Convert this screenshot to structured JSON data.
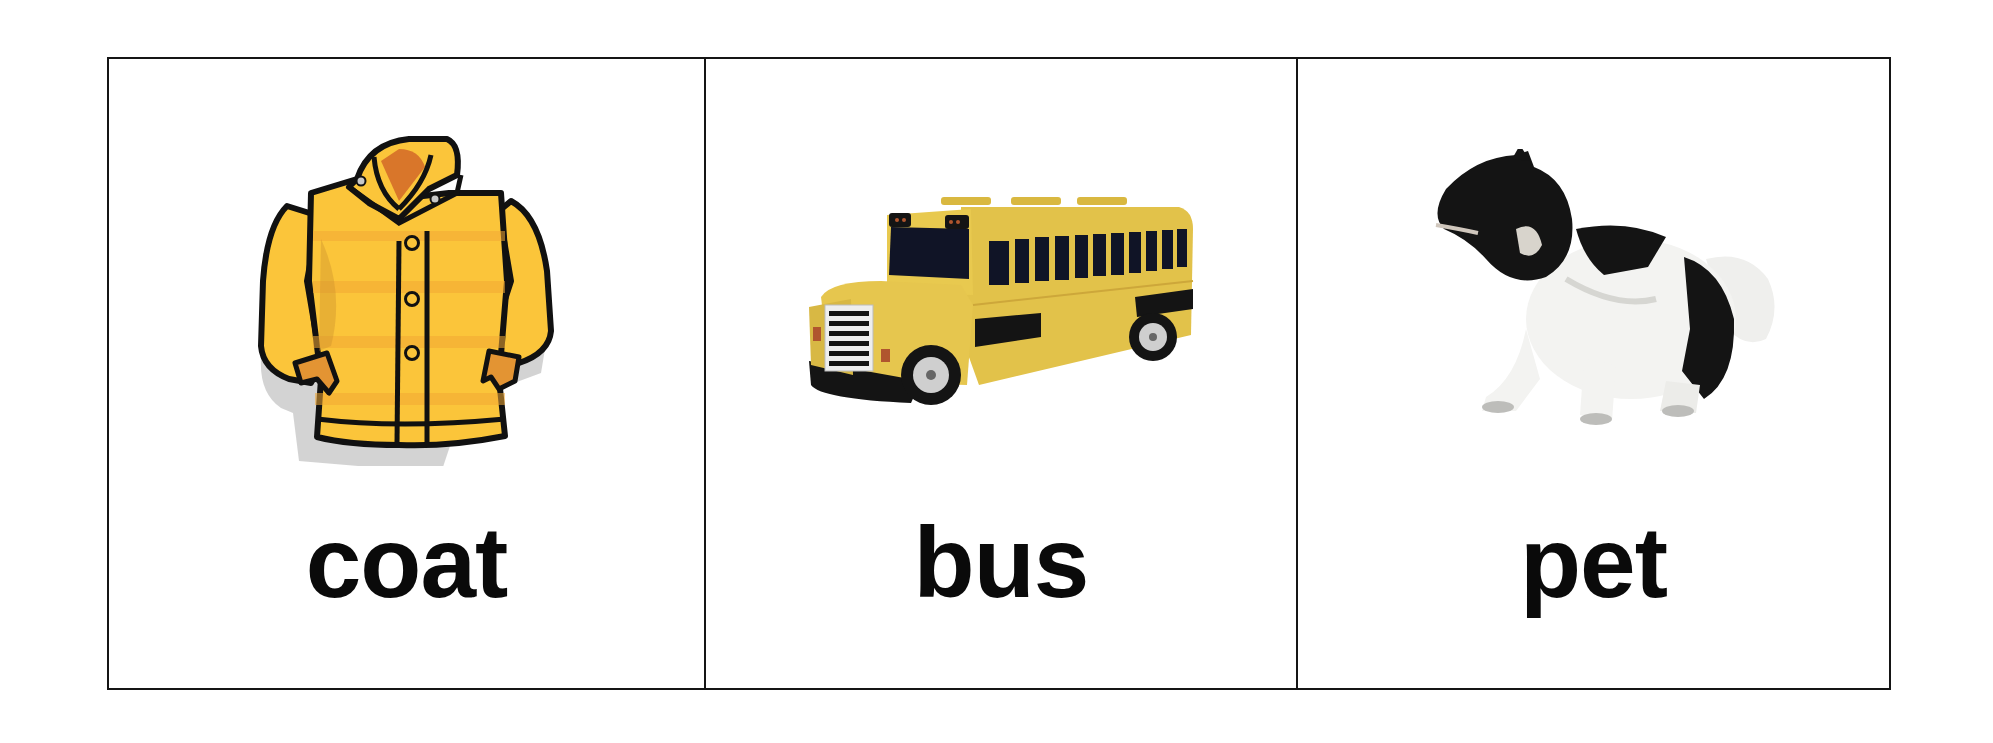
{
  "worksheet": {
    "cards": [
      {
        "word": "coat",
        "image": "yellow-coat-illustration",
        "colors": {
          "body": "#fbc53a",
          "shade": "#f0a532",
          "collar_inner": "#d9762a",
          "outline": "#111111",
          "shadow": "#bdbdbd"
        }
      },
      {
        "word": "bus",
        "image": "yellow-school-bus-toy",
        "colors": {
          "body": "#e2c24a",
          "window": "#101426",
          "trim": "#151515",
          "grille": "#f2f2f2",
          "light": "#b0552e"
        }
      },
      {
        "word": "pet",
        "image": "black-and-white-dog-photo",
        "colors": {
          "fur_dark": "#141414",
          "fur_light": "#f3f3f1",
          "shade": "#c9c9c6"
        }
      }
    ]
  }
}
